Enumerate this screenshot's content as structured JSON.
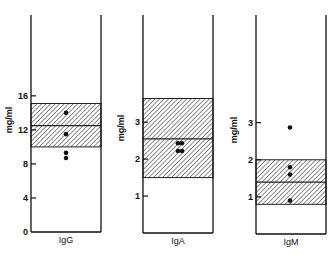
{
  "chart_data": [
    {
      "type": "scatter",
      "title": "",
      "panel": "IgG",
      "xlabel": "IgG",
      "ylabel": "mg/ml",
      "yticks": [
        0,
        4,
        8,
        12,
        16
      ],
      "ylim": [
        0,
        25.5
      ],
      "normal_range": {
        "low": 10.0,
        "mean": 12.5,
        "high": 15.1
      },
      "values": [
        14.0,
        11.5,
        9.3,
        8.7
      ]
    },
    {
      "type": "scatter",
      "title": "",
      "panel": "IgA",
      "xlabel": "IgA",
      "ylabel": "mg/ml",
      "yticks": [
        1,
        2,
        3
      ],
      "ylim": [
        0,
        5.9
      ],
      "normal_range": {
        "low": 1.5,
        "mean": 2.55,
        "high": 3.64
      },
      "values": [
        2.43,
        2.43,
        2.22,
        2.22
      ]
    },
    {
      "type": "scatter",
      "title": "",
      "panel": "IgM",
      "xlabel": "IgM",
      "ylabel": "mg/ml",
      "yticks": [
        1,
        2,
        3
      ],
      "ylim": [
        0,
        5.9
      ],
      "normal_range": {
        "low": 0.8,
        "mean": 1.4,
        "high": 2.0
      },
      "values": [
        2.87,
        1.8,
        1.6,
        0.9
      ]
    }
  ],
  "labels": {
    "ylabel": "mg/ml",
    "panels": [
      "IgG",
      "IgA",
      "IgM"
    ]
  }
}
